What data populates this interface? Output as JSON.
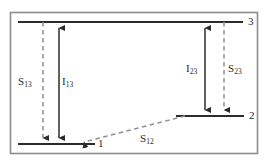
{
  "figure": {
    "kind": "energy-level-diagram",
    "border_color": "#8c8c8c",
    "line_color": "#2b2b2b",
    "dash_color": "#8f8f8f",
    "background": "#ffffff"
  },
  "levels": [
    {
      "id": "level-3",
      "label": "3",
      "y": 22,
      "x_start": 18,
      "x_end": 243
    },
    {
      "id": "level-2",
      "label": "2",
      "y": 116,
      "x_start": 176,
      "x_end": 244
    },
    {
      "id": "level-1",
      "label": "1",
      "y": 144,
      "x_start": 18,
      "x_end": 95
    }
  ],
  "transitions": [
    {
      "id": "s13",
      "symbol": "S",
      "subscript": "13",
      "style": "dashed",
      "arrow": "down",
      "from_level": "3",
      "to_level": "1",
      "x": 43,
      "label_x": 18,
      "label_y": 76
    },
    {
      "id": "i13",
      "symbol": "I",
      "subscript": "13",
      "style": "solid",
      "arrow": "double",
      "from_level": "3",
      "to_level": "1",
      "x": 59,
      "label_x": 62,
      "label_y": 76
    },
    {
      "id": "i23",
      "symbol": "I",
      "subscript": "23",
      "style": "solid",
      "arrow": "double",
      "from_level": "3",
      "to_level": "2",
      "x": 205,
      "label_x": 186,
      "label_y": 63
    },
    {
      "id": "s23",
      "symbol": "S",
      "subscript": "23",
      "style": "dashed",
      "arrow": "down",
      "from_level": "3",
      "to_level": "2",
      "x": 224,
      "label_x": 228,
      "label_y": 63
    },
    {
      "id": "s12",
      "symbol": "S",
      "subscript": "12",
      "style": "dashed",
      "arrow": "left",
      "from_level": "2",
      "to_level": "1",
      "label_x": 140,
      "label_y": 133
    }
  ],
  "labels": {
    "level3": "3",
    "level2": "2",
    "level1": "1",
    "s13_sym": "S",
    "s13_sub": "13",
    "i13_sym": "I",
    "i13_sub": "13",
    "i23_sym": "I",
    "i23_sub": "23",
    "s23_sym": "S",
    "s23_sub": "23",
    "s12_sym": "S",
    "s12_sub": "12"
  }
}
